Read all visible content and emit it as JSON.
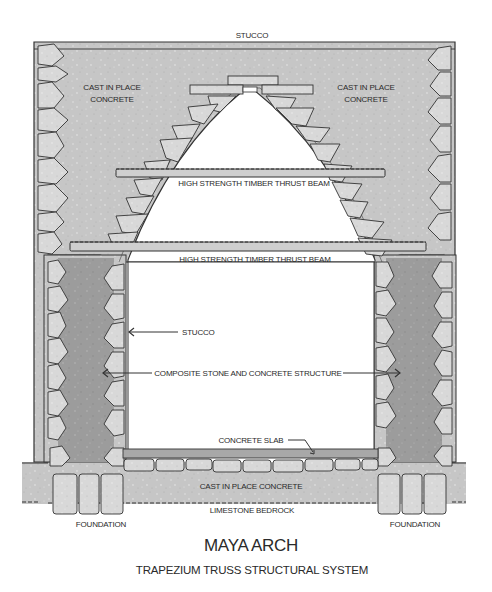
{
  "diagram": {
    "title": "MAYA ARCH",
    "subtitle": "TRAPEZIUM TRUSS STRUCTURAL SYSTEM",
    "labels": {
      "stucco_top": "STUCCO",
      "cast_left_1": "CAST IN PLACE",
      "cast_left_2": "CONCRETE",
      "cast_right_1": "CAST IN PLACE",
      "cast_right_2": "CONCRETE",
      "beam_upper": "HIGH STRENGTH TIMBER THRUST BEAM",
      "beam_lower": "HIGH STRENGTH TIMBER THRUST BEAM",
      "stucco_wall": "STUCCO",
      "composite": "COMPOSITE STONE AND CONCRETE STRUCTURE",
      "slab": "CONCRETE SLAB",
      "cast_floor": "CAST IN PLACE CONCRETE",
      "bedrock": "LIMESTONE BEDROCK",
      "foundation_left": "FOUNDATION",
      "foundation_right": "FOUNDATION"
    },
    "colors": {
      "concrete": "#c4c4c4",
      "stone": "#d6d6d6",
      "core": "#9a9a9a",
      "outline": "#333333",
      "text": "#2a2a2a"
    }
  }
}
